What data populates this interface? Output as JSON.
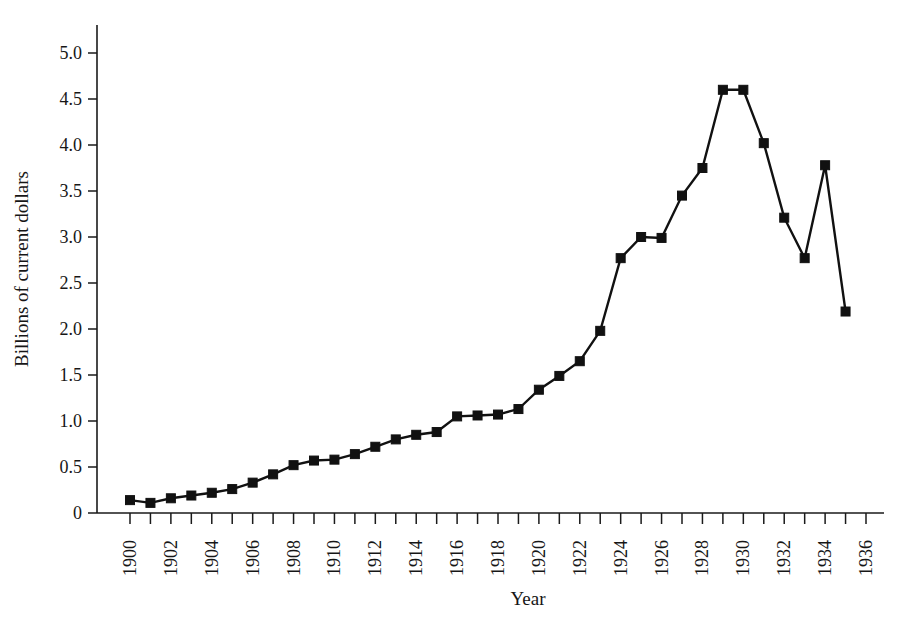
{
  "chart_data": {
    "type": "line",
    "title": "",
    "subtitle": "",
    "xlabel": "Year",
    "ylabel": "Billions of current dollars",
    "xlim": [
      1899,
      1936.5
    ],
    "ylim": [
      0,
      5.25
    ],
    "grid": false,
    "legend": null,
    "legend_position": "none",
    "marker": "filled-square",
    "line_color": "#111111",
    "marker_color": "#111111",
    "background_color": "#ffffff",
    "x": [
      1900,
      1901,
      1902,
      1903,
      1904,
      1905,
      1906,
      1907,
      1908,
      1909,
      1910,
      1911,
      1912,
      1913,
      1914,
      1915,
      1916,
      1917,
      1918,
      1919,
      1920,
      1921,
      1922,
      1923,
      1924,
      1925,
      1926,
      1927,
      1928,
      1929,
      1930,
      1931,
      1932,
      1933,
      1934,
      1935
    ],
    "values": [
      0.14,
      0.11,
      0.16,
      0.19,
      0.22,
      0.26,
      0.33,
      0.42,
      0.52,
      0.57,
      0.58,
      0.64,
      0.72,
      0.8,
      0.85,
      0.88,
      1.05,
      1.06,
      1.07,
      1.13,
      1.34,
      1.49,
      1.65,
      1.98,
      2.77,
      3.0,
      2.99,
      3.45,
      3.75,
      4.6,
      4.6,
      4.02,
      3.21,
      2.77,
      3.78,
      2.19
    ],
    "series": [
      {
        "name": "Billions of current dollars",
        "values": [
          0.14,
          0.11,
          0.16,
          0.19,
          0.22,
          0.26,
          0.33,
          0.42,
          0.52,
          0.57,
          0.58,
          0.64,
          0.72,
          0.8,
          0.85,
          0.88,
          1.05,
          1.06,
          1.07,
          1.13,
          1.34,
          1.49,
          1.65,
          1.98,
          2.77,
          3.0,
          2.99,
          3.45,
          3.75,
          4.6,
          4.6,
          4.02,
          3.21,
          2.77,
          3.78,
          2.19
        ]
      }
    ],
    "y_ticks": [
      0,
      0.5,
      1.0,
      1.5,
      2.0,
      2.5,
      3.0,
      3.5,
      4.0,
      4.5,
      5.0
    ],
    "y_tick_labels": [
      "0",
      "0.5",
      "1.0",
      "1.5",
      "2.0",
      "2.5",
      "3.0",
      "3.5",
      "4.0",
      "4.5",
      "5.0"
    ],
    "x_ticks": [
      1900,
      1901,
      1902,
      1903,
      1904,
      1905,
      1906,
      1907,
      1908,
      1909,
      1910,
      1911,
      1912,
      1913,
      1914,
      1915,
      1916,
      1917,
      1918,
      1919,
      1920,
      1921,
      1922,
      1923,
      1924,
      1925,
      1926,
      1927,
      1928,
      1929,
      1930,
      1931,
      1932,
      1933,
      1934,
      1935,
      1936
    ],
    "x_tick_labels": [
      "1900",
      "",
      "1902",
      "",
      "1904",
      "",
      "1906",
      "",
      "1908",
      "",
      "1910",
      "",
      "1912",
      "",
      "1914",
      "",
      "1916",
      "",
      "1918",
      "",
      "1920",
      "",
      "1922",
      "",
      "1924",
      "",
      "1926",
      "",
      "1928",
      "",
      "1930",
      "",
      "1932",
      "",
      "1934",
      "",
      "1936"
    ],
    "x_tick_label_rotation": -90
  }
}
